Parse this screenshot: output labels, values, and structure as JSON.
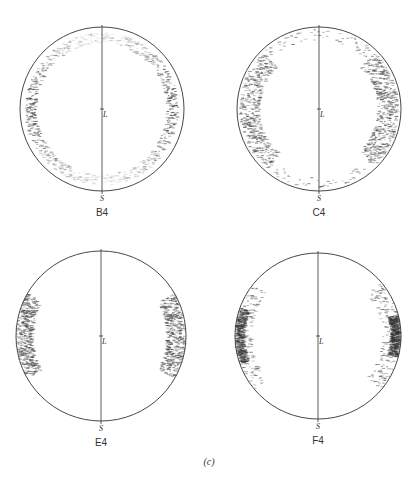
{
  "figure": {
    "caption": "(c)",
    "axis_labels": {
      "center": "L",
      "bottom": "S"
    },
    "ink_color": "#333333",
    "panels": [
      {
        "id": "B4",
        "label": "B4",
        "cx": 102,
        "cy": 109,
        "r": 82,
        "pattern": "ring",
        "regions": [
          {
            "type": "ring",
            "r_in": 0.8,
            "r_out": 0.93,
            "density": 0.55,
            "dark_sides": true
          }
        ]
      },
      {
        "id": "C4",
        "label": "C4",
        "cx": 319,
        "cy": 109,
        "r": 82,
        "pattern": "two-lobes",
        "regions": [
          {
            "type": "arc",
            "side": "left",
            "a0": 135,
            "a1": 230,
            "r_in": 0.72,
            "r_out": 0.96,
            "density": 0.8
          },
          {
            "type": "arc",
            "side": "right",
            "a0": -45,
            "a1": 45,
            "r_in": 0.72,
            "r_out": 0.97,
            "density": 0.85
          },
          {
            "type": "ring",
            "r_in": 0.84,
            "r_out": 0.97,
            "density": 0.12
          }
        ]
      },
      {
        "id": "E4",
        "label": "E4",
        "cx": 101,
        "cy": 336,
        "r": 85,
        "pattern": "edge-clusters",
        "regions": [
          {
            "type": "arc",
            "a0": 150,
            "a1": 210,
            "r_in": 0.8,
            "r_out": 0.99,
            "density": 0.85
          },
          {
            "type": "arc",
            "a0": -30,
            "a1": 30,
            "r_in": 0.78,
            "r_out": 0.99,
            "density": 0.85
          }
        ]
      },
      {
        "id": "F4",
        "label": "F4",
        "cx": 318,
        "cy": 336,
        "r": 83,
        "pattern": "edge-clusters",
        "regions": [
          {
            "type": "arc",
            "a0": 160,
            "a1": 200,
            "r_in": 0.88,
            "r_out": 0.99,
            "density": 0.9
          },
          {
            "type": "arc",
            "a0": 140,
            "a1": 220,
            "r_in": 0.8,
            "r_out": 0.99,
            "density": 0.25
          },
          {
            "type": "arc",
            "a0": -15,
            "a1": 15,
            "r_in": 0.88,
            "r_out": 0.99,
            "density": 0.95
          },
          {
            "type": "arc",
            "a0": -40,
            "a1": 40,
            "r_in": 0.78,
            "r_out": 0.99,
            "density": 0.3
          }
        ]
      }
    ]
  }
}
